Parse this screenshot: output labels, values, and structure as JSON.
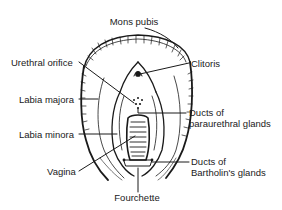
{
  "diagram": {
    "type": "anatomical-line-drawing",
    "colors": {
      "ink": "#1a1a1a",
      "background": "#ffffff"
    }
  },
  "labels": {
    "mons_pubis": "Mons pubis",
    "urethral_orifice": "Urethral orifice",
    "clitoris": "Clitoris",
    "labia_majora": "Labia majora",
    "labia_minora": "Labia minora",
    "vagina": "Vagina",
    "paraurethral_line1": "Ducts of",
    "paraurethral_line2": "paraurethral glands",
    "bartholin_line1": "Ducts of",
    "bartholin_line2": "Bartholin's glands",
    "fourchette": "Fourchette"
  }
}
